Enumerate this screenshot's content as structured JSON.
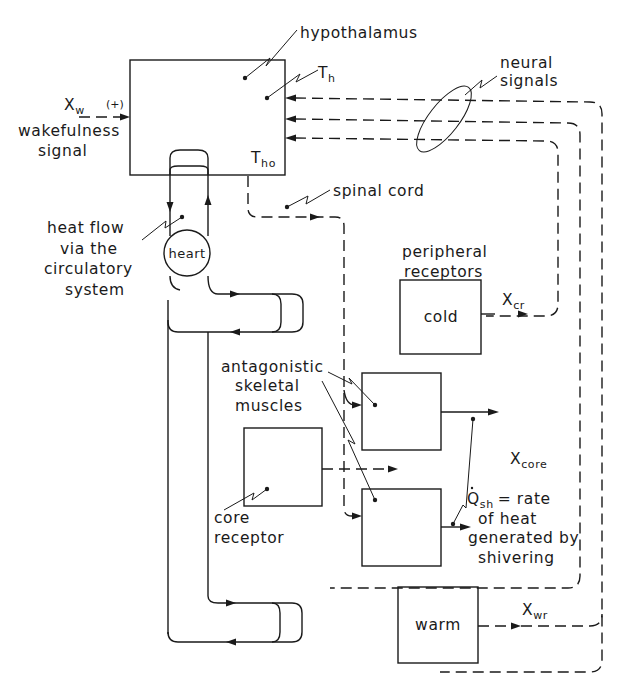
{
  "diagram": {
    "labels": {
      "hypothalamus": "hypothalamus",
      "t_h_main": "T",
      "t_h_sub": "h",
      "t_ho_main": "T",
      "t_ho_sub": "ho",
      "x_w_main": "X",
      "x_w_sub": "w",
      "x_w_sign": "(+)",
      "wakefulness_line1": "wakefulness",
      "wakefulness_line2": "signal",
      "neural_line1": "neural",
      "neural_line2": "signals",
      "spinal_cord": "spinal cord",
      "heat_flow_line1": "heat flow",
      "heat_flow_line2": "via the",
      "heat_flow_line3": "circulatory",
      "heat_flow_line4": "system",
      "heart": "heart",
      "peripheral_line1": "peripheral",
      "peripheral_line2": "receptors",
      "cold": "cold",
      "x_cr_main": "X",
      "x_cr_sub": "cr",
      "muscles_line1": "antagonistic",
      "muscles_line2": "skeletal",
      "muscles_line3": "muscles",
      "x_core_main": "X",
      "x_core_sub": "core",
      "core_receptor_line1": "core",
      "core_receptor_line2": "receptor",
      "q_sh_main": "Q",
      "q_sh_sub": "sh",
      "q_sh_rest": "= rate",
      "q_sh_line2": "of heat",
      "q_sh_line3": "generated by",
      "q_sh_line4": "shivering",
      "warm": "warm",
      "x_wr_main": "X",
      "x_wr_sub": "wr"
    },
    "nodes": [
      {
        "id": "hypothalamus",
        "label": "hypothalamus",
        "shape": "box"
      },
      {
        "id": "heart",
        "label": "heart",
        "shape": "circle"
      },
      {
        "id": "cold",
        "label": "cold",
        "shape": "box"
      },
      {
        "id": "muscle-upper",
        "label": "",
        "shape": "box"
      },
      {
        "id": "muscle-lower",
        "label": "",
        "shape": "box"
      },
      {
        "id": "core-receptor",
        "label": "",
        "shape": "box"
      },
      {
        "id": "warm",
        "label": "warm",
        "shape": "box"
      }
    ],
    "edges": [
      {
        "from": "wakefulness signal",
        "to": "hypothalamus",
        "label": "Xw (+)",
        "style": "dashed"
      },
      {
        "from": "cold",
        "to": "hypothalamus",
        "label": "Xcr",
        "style": "dashed"
      },
      {
        "from": "core-receptor",
        "to": "hypothalamus",
        "label": "Xcore",
        "style": "dashed"
      },
      {
        "from": "warm",
        "to": "hypothalamus",
        "label": "Xwr",
        "style": "dashed"
      },
      {
        "from": "hypothalamus",
        "to": "muscle-upper",
        "label": "spinal cord",
        "style": "dashed"
      },
      {
        "from": "hypothalamus",
        "to": "muscle-lower",
        "label": "spinal cord",
        "style": "dashed"
      },
      {
        "from": "muscle-upper",
        "to": "output",
        "label": "",
        "style": "solid"
      },
      {
        "from": "muscle-lower",
        "to": "output",
        "label": "Qsh",
        "style": "solid"
      },
      {
        "from": "heart",
        "to": "hypothalamus",
        "label": "heat flow via the circulatory system",
        "style": "solid"
      }
    ]
  }
}
